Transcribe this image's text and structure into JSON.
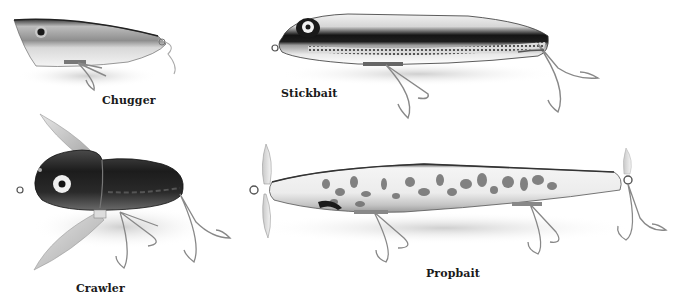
{
  "figure": {
    "background": "#ffffff",
    "lures": [
      {
        "id": "chugger",
        "label": "Chugger",
        "body_color": "#9a9a9a",
        "eye_color": "#1a1a1a"
      },
      {
        "id": "stickbait",
        "label": "Stickbait",
        "body_color": "#202020",
        "eye_color": "#ffffff"
      },
      {
        "id": "crawler",
        "label": "Crawler",
        "body_color": "#2a2a2a",
        "eye_color": "#ffffff"
      },
      {
        "id": "propbait",
        "label": "Propbait",
        "body_color": "#e8e8e8",
        "pattern_color": "#6e6e6e"
      }
    ]
  }
}
